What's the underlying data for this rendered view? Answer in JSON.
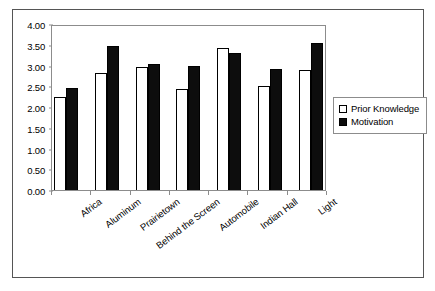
{
  "chart_data": {
    "type": "bar",
    "title": "",
    "xlabel": "",
    "ylabel": "",
    "ylim": [
      0,
      4.0
    ],
    "ytick_step": 0.5,
    "ytick_labels": [
      "0.00",
      "0.50",
      "1.00",
      "1.50",
      "2.00",
      "2.50",
      "3.00",
      "3.50",
      "4.00"
    ],
    "grid": false,
    "legend_position": "right",
    "categories": [
      "Africa",
      "Aluminum",
      "Prairietown",
      "Behind the Screen",
      "Automobile",
      "Indian Hall",
      "Light"
    ],
    "series": [
      {
        "name": "Prior Knowledge",
        "color": "#ffffff",
        "edge_color": "#000000",
        "values": [
          2.25,
          2.81,
          2.96,
          2.43,
          3.42,
          2.5,
          2.9
        ]
      },
      {
        "name": "Motivation",
        "color": "#0d0d0d",
        "edge_color": "#000000",
        "values": [
          2.45,
          3.46,
          3.03,
          3.0,
          3.3,
          2.91,
          3.54
        ]
      }
    ]
  },
  "legend": {
    "entries": [
      {
        "label": "Prior Knowledge",
        "swatch": "hollow-square"
      },
      {
        "label": "Motivation",
        "swatch": "filled-square"
      }
    ]
  },
  "colors": {
    "frame": "#555555",
    "axis": "#8c8c8c",
    "background": "#ffffff",
    "text": "#000000"
  }
}
